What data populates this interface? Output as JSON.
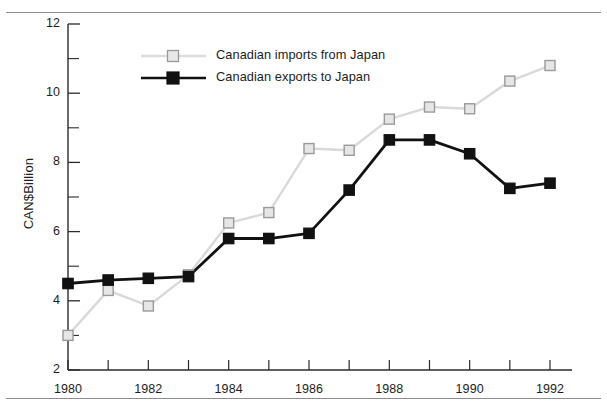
{
  "chart_data": {
    "type": "line",
    "title": "",
    "subtitle": "",
    "xlabel": "",
    "ylabel": "CAN$Billion",
    "x": [
      1980,
      1981,
      1982,
      1983,
      1984,
      1985,
      1986,
      1987,
      1988,
      1989,
      1990,
      1991,
      1992
    ],
    "xlim": [
      1980,
      1992
    ],
    "ylim": [
      2,
      12
    ],
    "y_major_ticks": [
      2,
      4,
      6,
      8,
      10,
      12
    ],
    "y_tick_labels": [
      "2",
      "4",
      "6",
      "8",
      "10",
      "12"
    ],
    "y_minor_ticks": [
      3,
      5,
      7,
      9,
      11
    ],
    "x_tick_labels": [
      "1980",
      "",
      "1982",
      "",
      "1984",
      "",
      "1986",
      "",
      "1988",
      "",
      "1990",
      "",
      "1992"
    ],
    "x_labeled_years": [
      "1980",
      "1982",
      "1984",
      "1986",
      "1988",
      "1990",
      "1992"
    ],
    "grid": false,
    "legend_position": "upper-left-inset",
    "series": [
      {
        "name": "Canadian imports from Japan",
        "marker": "open-square",
        "color": "#d9d9d9",
        "marker_edge_color": "#9a9a9a",
        "marker_face_color": "#e6e6e6",
        "values": [
          3.0,
          4.3,
          3.85,
          4.75,
          6.25,
          6.55,
          8.4,
          8.35,
          9.25,
          9.6,
          9.55,
          10.35,
          10.8
        ]
      },
      {
        "name": "Canadian exports to Japan",
        "marker": "filled-square",
        "color": "#111111",
        "marker_edge_color": "#111111",
        "marker_face_color": "#111111",
        "values": [
          4.5,
          4.6,
          4.65,
          4.7,
          5.8,
          5.8,
          5.95,
          7.2,
          8.65,
          8.65,
          8.25,
          7.25,
          7.4
        ]
      }
    ]
  },
  "legend": {
    "items": [
      {
        "label": "Canadian imports from Japan"
      },
      {
        "label": "Canadian exports to Japan"
      }
    ]
  },
  "axis": {
    "y_title": "CAN$Billion"
  },
  "colors": {
    "imports_line": "#d9d9d9",
    "exports_line": "#111111",
    "axis": "#2b2b2b",
    "rule": "#8c8c8c",
    "text": "#1d1d1d",
    "background": "#ffffff"
  }
}
